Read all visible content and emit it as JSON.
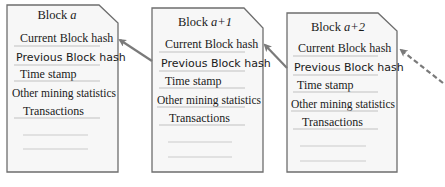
{
  "diagram": {
    "type": "blockchain",
    "colors": {
      "block_border": "#6e6e6e",
      "block_fill": "#f6f6f6",
      "arrow": "#7a7a7a",
      "rule_line": "#b4b4b4",
      "text": "#1a1a1a"
    },
    "blocks": [
      {
        "id": "block-a",
        "title_prefix": "Block ",
        "title_var": "a",
        "fields": [
          "Current Block hash",
          "Previous Block hash",
          "Time stamp",
          "Other mining statistics",
          "Transactions"
        ]
      },
      {
        "id": "block-a1",
        "title_prefix": "Block ",
        "title_var": "a+1",
        "fields": [
          "Current Block hash",
          "Previous Block hash",
          "Time stamp",
          "Other mining statistics",
          "Transactions"
        ]
      },
      {
        "id": "block-a2",
        "title_prefix": "Block ",
        "title_var": "a+2",
        "fields": [
          "Current Block hash",
          "Previous Block hash",
          "Time stamp",
          "Other mining statistics",
          "Transactions"
        ]
      }
    ],
    "arrows": [
      {
        "from": "block-a1.previous_block_hash",
        "to": "block-a.current_block_hash",
        "style": "solid"
      },
      {
        "from": "block-a2.previous_block_hash",
        "to": "block-a1.current_block_hash",
        "style": "solid"
      },
      {
        "from": "next-block",
        "to": "block-a2.current_block_hash",
        "style": "dashed"
      }
    ]
  }
}
